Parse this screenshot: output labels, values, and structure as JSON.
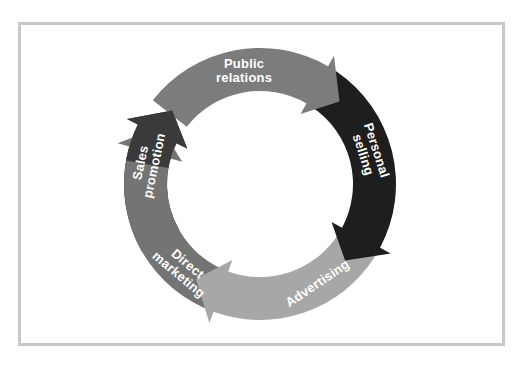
{
  "diagram": {
    "frame_color": "#c9c9c9",
    "center": [
      260,
      184
    ],
    "outer_radius": 136,
    "inner_radius": 93,
    "segments": [
      {
        "id": "public-relations",
        "lines": [
          "Public",
          "relations"
        ],
        "color": "#7c7c7c",
        "start_angle": -52,
        "end_angle": 36,
        "label_mode": "arc"
      },
      {
        "id": "personal-selling",
        "lines": [
          "Personal",
          "selling"
        ],
        "color": "#1e1e1e",
        "start_angle": 36,
        "end_angle": 124,
        "label_mode": "arc"
      },
      {
        "id": "advertising",
        "lines": [
          "Advertising"
        ],
        "color": "#a7a7a7",
        "start_angle": 124,
        "end_angle": 208,
        "label_mode": "arc"
      },
      {
        "id": "direct-marketing",
        "lines": [
          "Direct",
          "marketing"
        ],
        "color": "#747474",
        "start_angle": 208,
        "end_angle": 296,
        "label_mode": "arc"
      },
      {
        "id": "sales-promotion",
        "lines": [
          "Sales",
          "promotion"
        ],
        "color": "#3a3a3a",
        "start_angle": 296,
        "end_angle": 308,
        "label_mode": "arc"
      }
    ]
  }
}
